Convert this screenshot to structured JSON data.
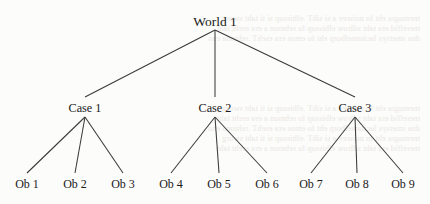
{
  "diagram": {
    "type": "tree",
    "title_node": "World 1",
    "levels": 3,
    "line_color": "#3a3a3a",
    "text_color": "#1a1a1a",
    "background_color": "#fcfcfa",
    "root": {
      "label": "World 1",
      "x": 215,
      "y": 22
    },
    "cases": [
      {
        "label": "Case 1",
        "x": 85,
        "y": 110
      },
      {
        "label": "Case 2",
        "x": 215,
        "y": 110
      },
      {
        "label": "Case 3",
        "x": 355,
        "y": 110
      }
    ],
    "observations": [
      {
        "label": "Ob 1",
        "x": 27,
        "y": 186,
        "parent": 0
      },
      {
        "label": "Ob 2",
        "x": 75,
        "y": 186,
        "parent": 0
      },
      {
        "label": "Ob 3",
        "x": 123,
        "y": 186,
        "parent": 0
      },
      {
        "label": "Ob 4",
        "x": 171,
        "y": 186,
        "parent": 1
      },
      {
        "label": "Ob 5",
        "x": 219,
        "y": 186,
        "parent": 1
      },
      {
        "label": "Ob 6",
        "x": 267,
        "y": 186,
        "parent": 1
      },
      {
        "label": "Ob 7",
        "x": 311,
        "y": 186,
        "parent": 2
      },
      {
        "label": "Ob 8",
        "x": 357,
        "y": 186,
        "parent": 2
      },
      {
        "label": "Ob 9",
        "x": 403,
        "y": 186,
        "parent": 2
      }
    ]
  },
  "bleed_through": {
    "description": "faint show-through text from the reverse side of the page",
    "lines": [
      "tnemugra eht fo noisrev a si sihT .elbissop si ti taht sworg",
      "tnereffid era taht sdlrow elbissop fo rebmun a era ereht taht",
      "dna smetsys lacitamelborp eht fo emos era esehT .rehtona eno"
    ]
  }
}
